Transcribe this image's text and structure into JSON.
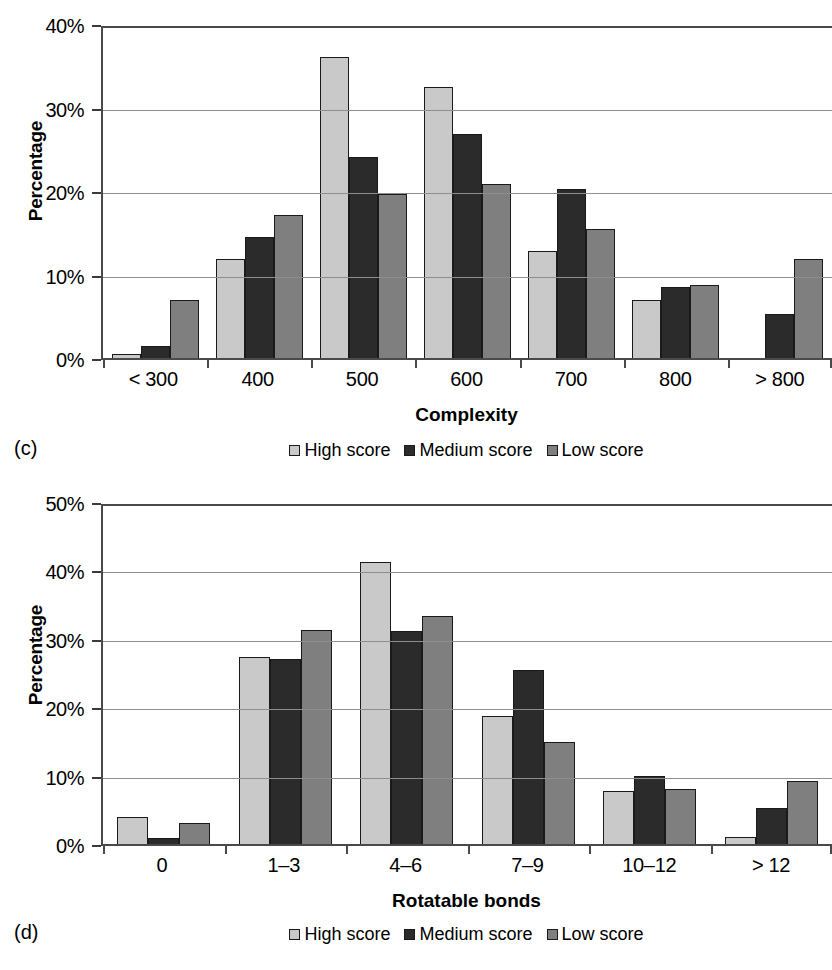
{
  "series_colors": {
    "high": "#c9c9c9",
    "medium": "#2b2b2b",
    "low": "#7f7f7f"
  },
  "legend": {
    "items": [
      {
        "label": "High score",
        "key": "high"
      },
      {
        "label": "Medium score",
        "key": "medium"
      },
      {
        "label": "Low score",
        "key": "low"
      }
    ]
  },
  "panel_c": {
    "tag": "(c)",
    "ylabel": "Percentage",
    "xtitle": "Complexity",
    "yticks": [
      "40%",
      "30%",
      "20%",
      "10%",
      "0%"
    ],
    "xticks": [
      "< 300",
      "400",
      "500",
      "600",
      "700",
      "800",
      "> 800"
    ]
  },
  "panel_d": {
    "tag": "(d)",
    "ylabel": "Percentage",
    "xtitle": "Rotatable bonds",
    "yticks": [
      "50%",
      "40%",
      "30%",
      "20%",
      "10%",
      "0%"
    ],
    "xticks": [
      "0",
      "1–3",
      "4–6",
      "7–9",
      "10–12",
      "> 12"
    ]
  },
  "chart_data": [
    {
      "type": "bar",
      "panel": "(c)",
      "title": "",
      "xlabel": "Complexity",
      "ylabel": "Percentage",
      "categories": [
        "< 300",
        "400",
        "500",
        "600",
        "700",
        "800",
        "> 800"
      ],
      "series": [
        {
          "name": "High score",
          "values": [
            0.5,
            11.8,
            36.1,
            32.4,
            12.8,
            6.9,
            0.0
          ]
        },
        {
          "name": "Medium score",
          "values": [
            1.4,
            14.5,
            24.1,
            26.8,
            20.3,
            8.5,
            5.3
          ]
        },
        {
          "name": "Low score",
          "values": [
            6.9,
            17.1,
            19.6,
            20.9,
            15.4,
            8.8,
            11.9
          ]
        }
      ],
      "ylim": [
        0,
        40
      ],
      "ytick_values": [
        0,
        10,
        20,
        30,
        40
      ],
      "ytick_labels": [
        "0%",
        "10%",
        "20%",
        "30%",
        "40%"
      ],
      "grid": true,
      "legend_position": "bottom"
    },
    {
      "type": "bar",
      "panel": "(d)",
      "title": "",
      "xlabel": "Rotatable bonds",
      "ylabel": "Percentage",
      "categories": [
        "0",
        "1–3",
        "4–6",
        "7–9",
        "10–12",
        "> 12"
      ],
      "series": [
        {
          "name": "High score",
          "values": [
            3.9,
            27.3,
            41.2,
            18.7,
            7.7,
            1.0
          ]
        },
        {
          "name": "Medium score",
          "values": [
            0.9,
            27.0,
            31.1,
            25.4,
            9.9,
            5.3
          ]
        },
        {
          "name": "Low score",
          "values": [
            3.0,
            31.3,
            33.4,
            14.9,
            8.0,
            9.2
          ]
        }
      ],
      "ylim": [
        0,
        50
      ],
      "ytick_values": [
        0,
        10,
        20,
        30,
        40,
        50
      ],
      "ytick_labels": [
        "0%",
        "10%",
        "20%",
        "30%",
        "40%",
        "50%"
      ],
      "grid": true,
      "legend_position": "bottom"
    }
  ]
}
